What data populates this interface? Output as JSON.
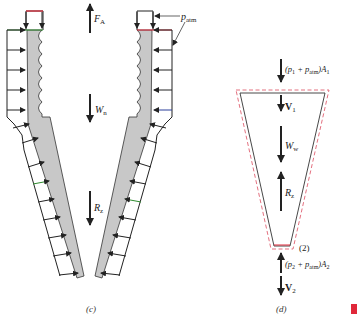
{
  "diagram": {
    "panel_c": {
      "caption": "(c)",
      "labels": {
        "FA": "F",
        "FA_sub": "A",
        "Wn": "W",
        "Wn_sub": "n",
        "Rz": "R",
        "Rz_sub": "z",
        "patm": "p",
        "patm_sub": "atm"
      }
    },
    "panel_d": {
      "caption": "(d)",
      "labels": {
        "top_force_open": "(p",
        "top_force_sub1": "1",
        "top_force_plus": " + p",
        "top_force_sub_atm": "atm",
        "top_force_close": ")A",
        "top_force_sub_A": "1",
        "V1": "V",
        "V1_sub": "1",
        "Ww": "W",
        "Ww_sub": "w",
        "Rz": "R",
        "Rz_sub": "z",
        "section2": "(2)",
        "bottom_force_open": "(p",
        "bottom_force_sub1": "2",
        "bottom_force_plus": " + p",
        "bottom_force_sub_atm": "atm",
        "bottom_force_close": ")A",
        "bottom_force_sub_A": "2",
        "V2": "V",
        "V2_sub": "2"
      }
    },
    "colors": {
      "nozzle_fill": "#c8c8c8",
      "outline": "#222222",
      "red_line": "#e0283a",
      "green_line": "#2e8b2e",
      "blue_arrow": "#2a3f9a",
      "control_volume_dash": "#e06070",
      "marker": "#e0283a"
    }
  }
}
